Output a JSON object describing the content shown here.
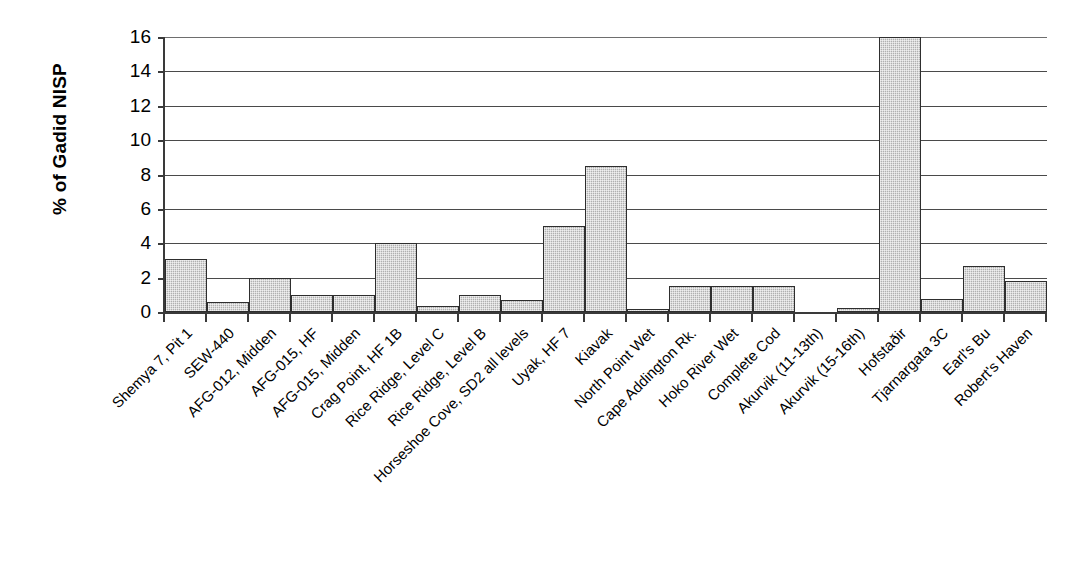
{
  "chart_data": {
    "type": "bar",
    "title": "",
    "xlabel": "",
    "ylabel": "% of Gadid NISP",
    "ylim": [
      0,
      16
    ],
    "ytick_labels": [
      "0",
      "2",
      "4",
      "6",
      "8",
      "10",
      "12",
      "14",
      "16"
    ],
    "ytick_values": [
      0,
      2,
      4,
      6,
      8,
      10,
      12,
      14,
      16
    ],
    "grid": true,
    "legend": false,
    "bar_color": "#b0b0b0",
    "bar_edge_color": "#2e2e2e",
    "axis_color": "#3a3a3a",
    "categories": [
      "Shemya 7, Pit 1",
      "SEW-440",
      "AFG-012, Midden",
      "AFG-015, HF",
      "AFG-015, Midden",
      "Crag Point, HF 1B",
      "Rice Ridge, Level C",
      "Rice Ridge, Level B",
      "Horseshoe Cove, SD2 all levels",
      "Uyak, HF 7",
      "Kiavak",
      "North Point Wet",
      "Cape Addington Rk.",
      "Hoko River Wet",
      "Complete Cod",
      "Akurvik (11-13th)",
      "Akurvik (15-16th)",
      "Hofstaðir",
      "Tjarnargata 3C",
      "Earl's Bu",
      "Robert's Haven"
    ],
    "values": [
      3.1,
      0.6,
      2.0,
      1.0,
      1.0,
      4.0,
      0.35,
      1.0,
      0.7,
      5.0,
      8.5,
      0.2,
      1.5,
      1.5,
      1.5,
      0.0,
      0.25,
      16.0,
      0.75,
      2.65,
      1.8
    ]
  }
}
